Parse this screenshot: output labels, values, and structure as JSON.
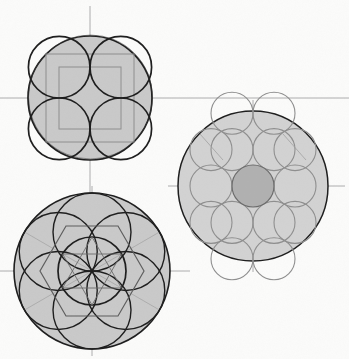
{
  "document": {
    "title": "Geometric circle-packing construction study",
    "medium": "pencil and ink on paper",
    "background_color": "#fbfbfa",
    "figure_count": 3
  },
  "palette": {
    "paper": "#fbfbfa",
    "shade_fill": "#c9c9c9",
    "shade_fill_light": "#d2d2d2",
    "ink_dark": "#1d1d1d",
    "ink_medium": "#4a4a4a",
    "ink_light": "#8e8e8e",
    "construction_line": "#a6a6a6",
    "axis_line": "#9a9a9a",
    "center_circle_fill": "#b0b0b0"
  },
  "figures": [
    {
      "id": "figure-square-packing",
      "name": "Four-circle square packing in a circle",
      "position": "top-left",
      "center": {
        "x": 90,
        "y": 98
      },
      "outer_circle": {
        "radius": 62,
        "stroke": "#1d1d1d",
        "stroke_width": 1.6,
        "fill": "#c9c9c9"
      },
      "inner_circles": {
        "count": 4,
        "radius": 30.8,
        "stroke": "#1d1d1d",
        "stroke_width": 1.7,
        "centers": [
          {
            "x": 59.2,
            "y": 67.2
          },
          {
            "x": 120.8,
            "y": 67.2
          },
          {
            "x": 59.2,
            "y": 128.8
          },
          {
            "x": 120.8,
            "y": 128.8
          }
        ]
      },
      "squares": [
        {
          "name": "outer-bounding-square",
          "half_side": 44,
          "stroke": "#8e8e8e",
          "stroke_width": 1.0
        },
        {
          "name": "inner-square",
          "half_side": 31,
          "stroke": "#8e8e8e",
          "stroke_width": 1.0
        }
      ],
      "axes": {
        "horizontal_y": 98,
        "vertical_x": 90,
        "h_extent": [
          0,
          349
        ],
        "v_extent": [
          6,
          196
        ],
        "stroke": "#9a9a9a",
        "stroke_width": 0.8
      }
    },
    {
      "id": "figure-hex-packing",
      "name": "Thirteen-circle hexagonal packing in a circle",
      "position": "right",
      "center": {
        "x": 253,
        "y": 186
      },
      "outer_circle": {
        "radius": 75,
        "stroke": "#1d1d1d",
        "stroke_width": 1.5,
        "fill": "#d2d2d2"
      },
      "unit_radius": 21,
      "packing": {
        "type": "hexagonal-lattice",
        "rings": [
          {
            "ring": 0,
            "count": 1,
            "fill": "#b0b0b0",
            "stroke": "#6a6a6a"
          },
          {
            "ring": 1,
            "count": 6,
            "fill": "none",
            "stroke": "#8e8e8e"
          },
          {
            "ring": 2,
            "count": 6,
            "fill": "none",
            "stroke": "#8e8e8e"
          }
        ],
        "total_circles": 13,
        "centers": [
          {
            "x": 253,
            "y": 186,
            "ring": 0
          },
          {
            "x": 295,
            "y": 186,
            "ring": 1
          },
          {
            "x": 274,
            "y": 149.6,
            "ring": 1
          },
          {
            "x": 232,
            "y": 149.6,
            "ring": 1
          },
          {
            "x": 211,
            "y": 186,
            "ring": 1
          },
          {
            "x": 232,
            "y": 222.4,
            "ring": 1
          },
          {
            "x": 274,
            "y": 222.4,
            "ring": 1
          },
          {
            "x": 295,
            "y": 222.4,
            "ring": 2
          },
          {
            "x": 295,
            "y": 149.6,
            "ring": 2
          },
          {
            "x": 211,
            "y": 149.6,
            "ring": 2
          },
          {
            "x": 211,
            "y": 222.4,
            "ring": 2
          },
          {
            "x": 232,
            "y": 113.2,
            "ring": 2
          },
          {
            "x": 274,
            "y": 113.2,
            "ring": 2
          },
          {
            "x": 232,
            "y": 258.8,
            "ring": 2
          },
          {
            "x": 274,
            "y": 258.8,
            "ring": 2
          }
        ]
      },
      "axes": {
        "horizontal_y": 186,
        "vertical_x": 253,
        "h_extent": [
          168,
          349
        ],
        "v_extent": [
          100,
          272
        ],
        "stroke": "#9a9a9a",
        "stroke_width": 0.8
      }
    },
    {
      "id": "figure-hex-rosette",
      "name": "Six-petal hexagonal rosette with inscribed hexagon and hexagram",
      "position": "bottom-left",
      "center": {
        "x": 92,
        "y": 271
      },
      "outer_circle": {
        "radius": 78,
        "stroke": "#1d1d1d",
        "stroke_width": 1.6,
        "fill": "#c9c9c9"
      },
      "petal_circles": {
        "count": 6,
        "radius": 39,
        "orbit_radius": 39,
        "stroke": "#1d1d1d",
        "stroke_width": 1.4,
        "angles_deg": [
          90,
          150,
          210,
          270,
          330,
          30
        ]
      },
      "central_circle": {
        "radius": 34,
        "stroke": "#1d1d1d",
        "stroke_width": 1.7,
        "fill": "none"
      },
      "hexagon": {
        "name": "outer-hexagon",
        "circumradius": 52,
        "orientation": "flat-top",
        "stroke": "#5d5d5d",
        "stroke_width": 1.2
      },
      "hexagram": {
        "name": "inner-hexagram",
        "circumradius": 34,
        "stroke": "#6a6a6a",
        "stroke_width": 0.9
      },
      "spokes": {
        "count": 6,
        "length": 78,
        "stroke": "#a6a6a6",
        "stroke_width": 0.8
      },
      "axes": {
        "horizontal_y": 271,
        "vertical_x": 92,
        "h_extent": [
          0,
          190
        ],
        "v_extent": [
          186,
          356
        ],
        "stroke": "#9a9a9a",
        "stroke_width": 0.8
      }
    }
  ]
}
